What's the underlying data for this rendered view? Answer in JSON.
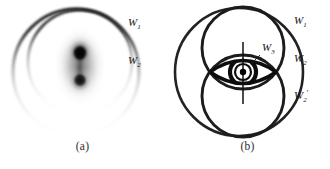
{
  "figure": {
    "background_color": "#ffffff",
    "ink_color": "#111111",
    "panels": [
      {
        "id": "a",
        "caption": "(a)",
        "description": "Blurred grayscale eye image inside two faded circular contours",
        "labels": [
          {
            "name": "W1",
            "base": "W",
            "sub": "1",
            "prime": "",
            "x": 128,
            "y": 26
          },
          {
            "name": "W2",
            "base": "W",
            "sub": "2",
            "prime": "",
            "x": 128,
            "y": 64
          }
        ],
        "circles": [
          {
            "name": "outer-contour",
            "cx": 76,
            "cy": 72,
            "r": 63
          },
          {
            "name": "inner-contour",
            "cx": 80,
            "cy": 62,
            "r": 52
          }
        ],
        "blob": {
          "cx": 80,
          "cy": 66,
          "rx": 26,
          "ry": 40
        }
      },
      {
        "id": "b",
        "caption": "(b)",
        "description": "Line-drawing eye with three circular wavefront contours",
        "labels": [
          {
            "name": "W1",
            "base": "W",
            "sub": "1",
            "prime": "",
            "x": 129,
            "y": 24
          },
          {
            "name": "W2",
            "base": "W",
            "sub": "2",
            "prime": "",
            "x": 129,
            "y": 62
          },
          {
            "name": "W2prime",
            "base": "W",
            "sub": "2",
            "prime": "′",
            "x": 129,
            "y": 99
          },
          {
            "name": "W3",
            "base": "W",
            "sub": "3",
            "prime": "",
            "x": 97,
            "y": 51
          }
        ],
        "circles": [
          {
            "name": "W1-outer-circle",
            "cx": 74,
            "cy": 72,
            "r": 64
          },
          {
            "name": "W2-upper-circle",
            "cx": 78,
            "cy": 48,
            "r": 41
          },
          {
            "name": "W2prime-lower-circle",
            "cx": 78,
            "cy": 96,
            "r": 41
          }
        ],
        "eye": {
          "cx": 78,
          "cy": 72,
          "half_width": 33,
          "half_height": 16,
          "iris_outer_r": 13,
          "iris_inner_r": 8,
          "pupil_r": 3.2,
          "axis_top": 42,
          "axis_bottom": 104
        }
      }
    ]
  }
}
